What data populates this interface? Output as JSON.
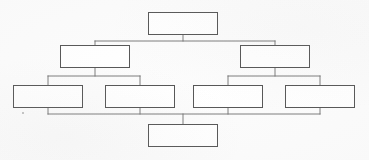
{
  "document": {
    "title": "Blank Hierarchy Diagram",
    "kind": "organizational-tree-diagram",
    "background_color": "#fcfcfc",
    "box_fill_color": "#ffffff",
    "box_border_color": "#565656",
    "connector_color": "#6e6e6e",
    "box_count": 8,
    "level_count": 4
  },
  "diagram": {
    "nodes": [
      {
        "id": "node-root",
        "label": "",
        "level": 1,
        "x": 148,
        "y": 12,
        "w": 70,
        "h": 23
      },
      {
        "id": "node-l2-a",
        "label": "",
        "level": 2,
        "x": 60,
        "y": 45,
        "w": 70,
        "h": 23
      },
      {
        "id": "node-l2-b",
        "label": "",
        "level": 2,
        "x": 240,
        "y": 45,
        "w": 70,
        "h": 23
      },
      {
        "id": "node-l3-a",
        "label": "",
        "level": 3,
        "x": 13,
        "y": 85,
        "w": 70,
        "h": 23
      },
      {
        "id": "node-l3-b",
        "label": "",
        "level": 3,
        "x": 105,
        "y": 85,
        "w": 70,
        "h": 23
      },
      {
        "id": "node-l3-c",
        "label": "",
        "level": 3,
        "x": 193,
        "y": 85,
        "w": 70,
        "h": 23
      },
      {
        "id": "node-l3-d",
        "label": "",
        "level": 3,
        "x": 285,
        "y": 85,
        "w": 70,
        "h": 23
      },
      {
        "id": "node-bottom",
        "label": "",
        "level": 4,
        "x": 148,
        "y": 124,
        "w": 70,
        "h": 23
      }
    ],
    "connectors": [
      {
        "id": "root-stem",
        "points": "183,35 183,41"
      },
      {
        "id": "level1-bus",
        "points": "95,41 275,41"
      },
      {
        "id": "l2a-stem",
        "points": "95,41 95,45"
      },
      {
        "id": "l2b-stem",
        "points": "275,41 275,45"
      },
      {
        "id": "l2a-drop",
        "points": "95,68 95,76"
      },
      {
        "id": "left-bus",
        "points": "48,76 140,76"
      },
      {
        "id": "l3a-stem",
        "points": "48,76 48,85"
      },
      {
        "id": "l3b-stem",
        "points": "140,76 140,85"
      },
      {
        "id": "l2b-drop",
        "points": "275,68 275,76"
      },
      {
        "id": "right-bus",
        "points": "228,76 320,76"
      },
      {
        "id": "l3c-stem",
        "points": "228,76 228,85"
      },
      {
        "id": "l3d-stem",
        "points": "320,76 320,85"
      },
      {
        "id": "l3a-down",
        "points": "48,108 48,114"
      },
      {
        "id": "l3b-down",
        "points": "140,108 140,114"
      },
      {
        "id": "l3c-down",
        "points": "228,108 228,114"
      },
      {
        "id": "l3d-down",
        "points": "320,108 320,114"
      },
      {
        "id": "bottom-bus",
        "points": "48,114 320,114"
      },
      {
        "id": "bottom-stem",
        "points": "183,114 183,124"
      }
    ],
    "artifacts": [
      {
        "id": "scan-speck-1",
        "x": 22,
        "y": 112
      }
    ]
  }
}
